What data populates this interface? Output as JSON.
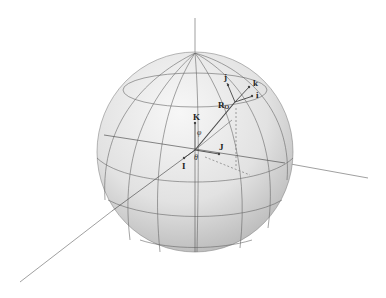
{
  "diagram": {
    "type": "3d-sphere-coordinate-system",
    "labels": {
      "K": "K",
      "I": "I",
      "J": "J",
      "phi": "φ",
      "theta": "θ",
      "R_O": "R",
      "R_O_sub": "O",
      "i": "i",
      "j": "j",
      "k": "k"
    },
    "colors": {
      "line": "#555555",
      "sphere_light": "#f2f2f2",
      "sphere_dark": "#bdbdbd"
    }
  }
}
